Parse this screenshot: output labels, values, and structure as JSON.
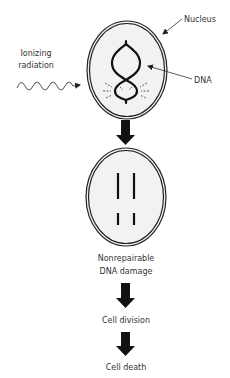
{
  "diagram": {
    "type": "flow",
    "labels": {
      "nucleus": "Nucleus",
      "dna": "DNA",
      "radiation_line1": "Ionizing",
      "radiation_line2": "radiation",
      "damage_line1": "Nonrepairable",
      "damage_line2": "DNA damage",
      "step_division": "Cell division",
      "step_death": "Cell death"
    },
    "icons": {
      "radiation": "wave-arrow-icon",
      "flow_arrow": "down-arrow-icon"
    },
    "colors": {
      "stroke": "#111111",
      "nucleus_fill": "#f2f2f2",
      "text": "#333333"
    },
    "nodes": [
      {
        "id": "cell-with-dna",
        "label": ""
      },
      {
        "id": "cell-with-broken-dna",
        "label": "Nonrepairable DNA damage"
      },
      {
        "id": "cell-division",
        "label": "Cell division"
      },
      {
        "id": "cell-death",
        "label": "Cell death"
      }
    ],
    "edges": [
      {
        "from": "cell-with-dna",
        "to": "cell-with-broken-dna"
      },
      {
        "from": "cell-with-broken-dna",
        "to": "cell-division"
      },
      {
        "from": "cell-division",
        "to": "cell-death"
      }
    ]
  }
}
